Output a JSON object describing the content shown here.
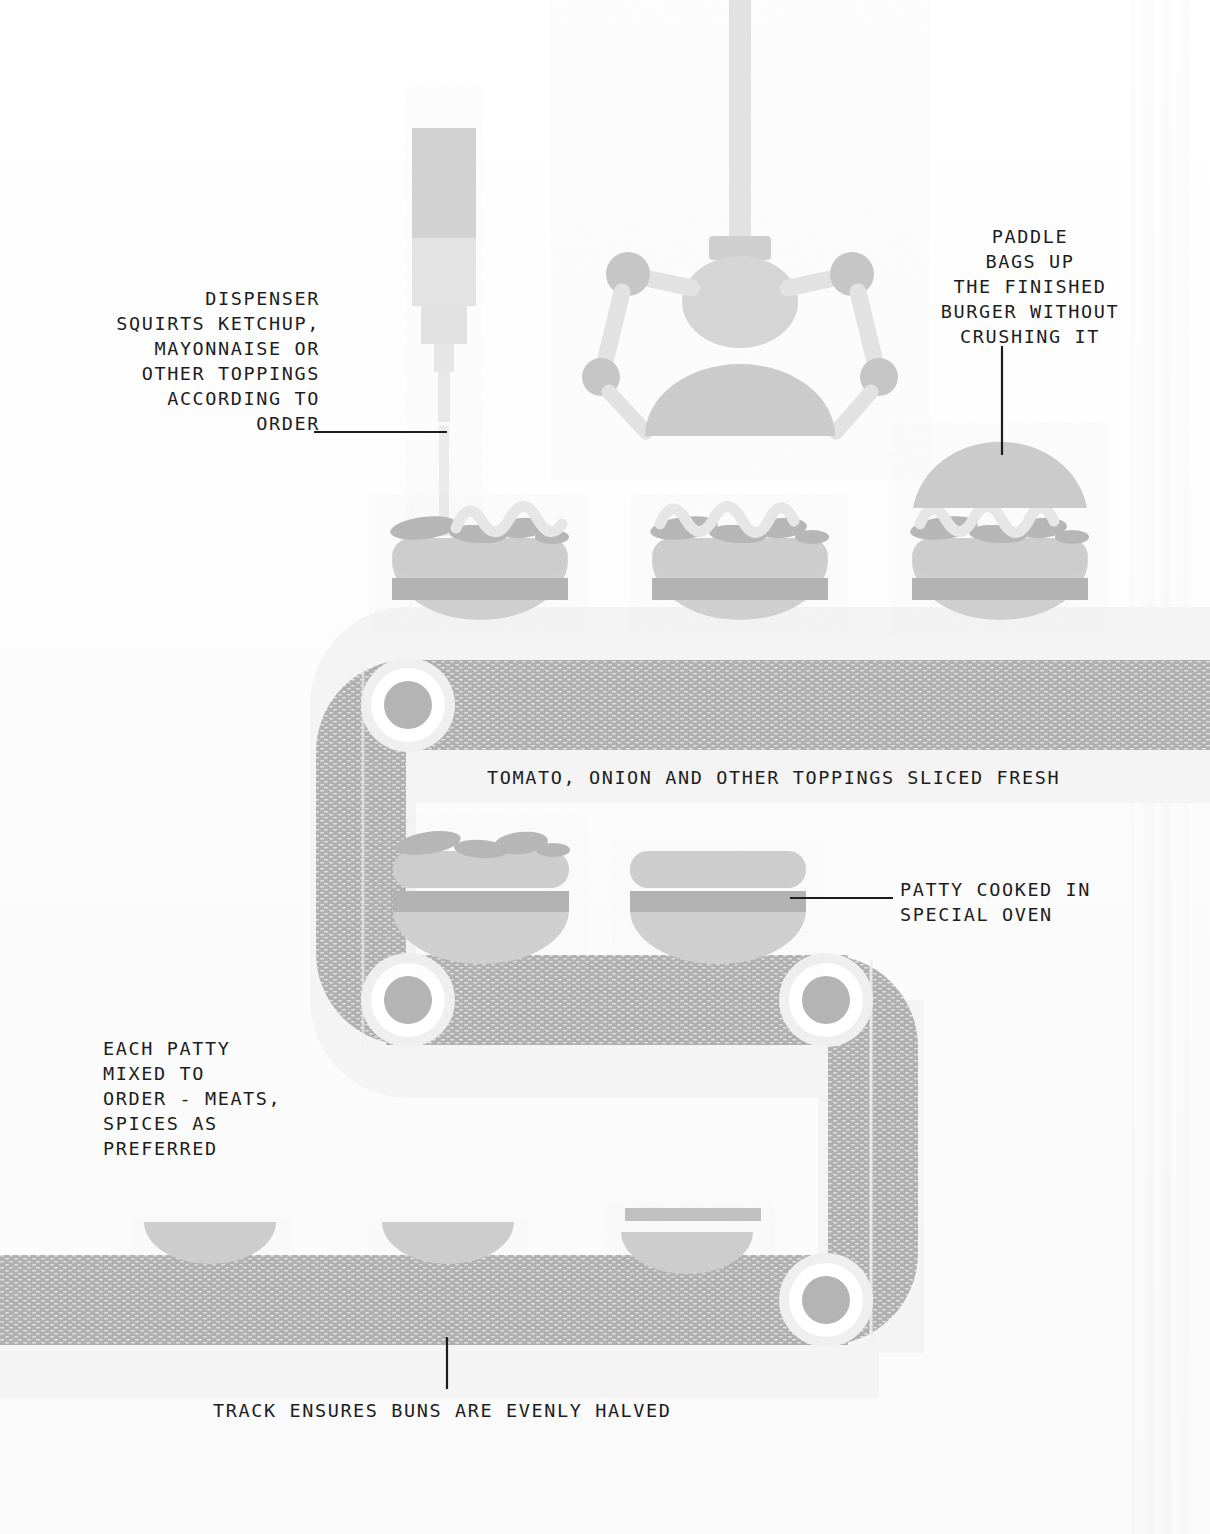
{
  "diagram": {
    "colors": {
      "background": "#fdfdfd",
      "belt_fill": "#b0b0b0",
      "belt_outline": "#f2f2f2",
      "pulley_inner": "#b4b4b4",
      "pulley_ring": "#ffffff",
      "bun": "#d4d4d4",
      "patty": "#b2b2b2",
      "topping": "#b6b6b6",
      "sauce": "#e4e4e4",
      "machine": "#d8d8d8",
      "machine_dark": "#c3c3c3",
      "text": "#1d1d1d",
      "leader_line": "#1d1d1d"
    },
    "annotations": [
      {
        "id": "dispenser",
        "name": "dispenser-label",
        "align": "right",
        "x": 20,
        "y": 286,
        "width": 300,
        "lines": [
          "DISPENSER",
          "SQUIRTS KETCHUP,",
          "MAYONNAISE OR",
          "OTHER TOPPINGS",
          "ACCORDING TO",
          "ORDER"
        ]
      },
      {
        "id": "paddle",
        "name": "paddle-label",
        "align": "center",
        "x": 900,
        "y": 224,
        "width": 260,
        "lines": [
          "PADDLE",
          "BAGS UP",
          "THE FINISHED",
          "BURGER WITHOUT",
          "CRUSHING IT"
        ]
      },
      {
        "id": "toppings",
        "name": "toppings-label",
        "align": "left",
        "x": 487,
        "y": 765,
        "width": 620,
        "lines": [
          "TOMATO, ONION AND OTHER TOPPINGS SLICED FRESH"
        ]
      },
      {
        "id": "patty-oven",
        "name": "patty-oven-label",
        "align": "left",
        "x": 900,
        "y": 877,
        "width": 280,
        "lines": [
          "PATTY COOKED IN",
          "SPECIAL OVEN"
        ]
      },
      {
        "id": "each-patty",
        "name": "each-patty-label",
        "align": "left",
        "x": 103,
        "y": 1036,
        "width": 280,
        "lines": [
          "EACH PATTY",
          "MIXED TO",
          "ORDER - MEATS,",
          "SPICES AS",
          "PREFERRED"
        ]
      },
      {
        "id": "track",
        "name": "track-label",
        "align": "left",
        "x": 213,
        "y": 1398,
        "width": 600,
        "lines": [
          "TRACK ENSURES BUNS ARE EVENLY HALVED"
        ]
      }
    ],
    "leader_lines": [
      {
        "name": "dispenser-leader",
        "x1": 314,
        "y1": 432,
        "x2": 447,
        "y2": 432
      },
      {
        "name": "paddle-leader",
        "x1": 1002,
        "y1": 346,
        "x2": 1002,
        "y2": 455
      },
      {
        "name": "patty-oven-leader",
        "x1": 790,
        "y1": 898,
        "x2": 893,
        "y2": 898
      },
      {
        "name": "track-leader",
        "x1": 447,
        "y1": 1337,
        "x2": 447,
        "y2": 1389
      }
    ],
    "machines": [
      {
        "name": "sauce-dispenser",
        "type": "dispenser",
        "x": 410,
        "y": 128
      },
      {
        "name": "robot-paddle-arm",
        "type": "gantry-robot",
        "x": 740,
        "y": 0
      }
    ],
    "burgers": [
      {
        "name": "burger-top-1",
        "stage": "saucing",
        "cx": 480,
        "cy": 590
      },
      {
        "name": "burger-top-2",
        "stage": "sauced",
        "cx": 740,
        "cy": 590
      },
      {
        "name": "burger-top-3",
        "stage": "finished",
        "cx": 1000,
        "cy": 560
      },
      {
        "name": "burger-mid-1",
        "stage": "topped",
        "cx": 480,
        "cy": 890
      },
      {
        "name": "burger-mid-2",
        "stage": "patty",
        "cx": 718,
        "cy": 890
      },
      {
        "name": "bun-bottom-1",
        "stage": "bun",
        "cx": 210,
        "cy": 1222
      },
      {
        "name": "bun-bottom-2",
        "stage": "bun",
        "cx": 448,
        "cy": 1222
      },
      {
        "name": "bun-bottom-3",
        "stage": "bun-halved",
        "cx": 687,
        "cy": 1222
      }
    ],
    "conveyor": {
      "name": "serpentine-conveyor-belt",
      "pulleys": [
        {
          "name": "pulley-top-left",
          "cx": 408,
          "cy": 705,
          "r": 42
        },
        {
          "name": "pulley-mid-left",
          "cx": 408,
          "cy": 1000,
          "r": 42
        },
        {
          "name": "pulley-mid-right",
          "cx": 826,
          "cy": 1000,
          "r": 42
        },
        {
          "name": "pulley-bottom-right",
          "cx": 826,
          "cy": 1300,
          "r": 42
        }
      ]
    }
  }
}
